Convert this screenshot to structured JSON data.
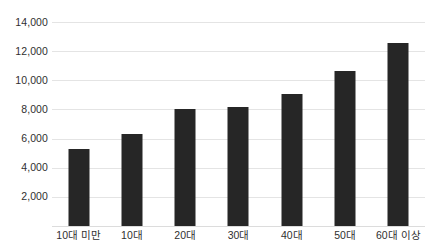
{
  "chart_data": {
    "type": "bar",
    "title": "",
    "subtitle": "",
    "xlabel": "",
    "ylabel": "",
    "categories": [
      "10대 미만",
      "10대",
      "20대",
      "30대",
      "40대",
      "50대",
      "60대 이상"
    ],
    "values": [
      5300,
      6300,
      8000,
      8150,
      9050,
      10650,
      12550
    ],
    "series": [
      {
        "name": "",
        "values": [
          5300,
          6300,
          8000,
          8150,
          9050,
          10650,
          12550
        ]
      }
    ],
    "ylim": [
      0,
      14000
    ],
    "y_tick_step": 2000,
    "y_tick_labels": [
      "14,000",
      "12,000",
      "10,000",
      "8,000",
      "6,000",
      "4,000",
      "2,000"
    ],
    "y_tick_values": [
      14000,
      12000,
      10000,
      8000,
      6000,
      4000,
      2000
    ],
    "grid": true,
    "grid_axis": "y",
    "legend": false,
    "legend_position": "none",
    "bar_color": "#262626",
    "gridline_color": "#e4e4e4",
    "background_color": "#ffffff",
    "text_color": "#2f2f2f"
  }
}
